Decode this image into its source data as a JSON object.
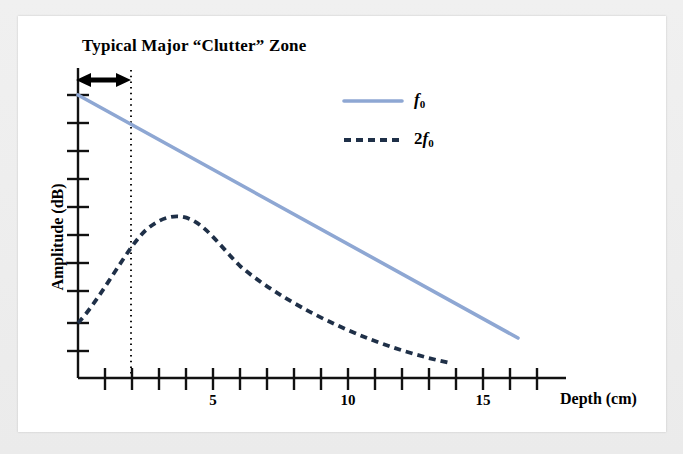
{
  "figure": {
    "title": "Typical Major “Clutter” Zone",
    "background_color": "#ffffff",
    "frame_color": "#f0f0f0"
  },
  "axes": {
    "x": {
      "label": "Depth (cm)",
      "tick_labels": [
        "5",
        "10",
        "15"
      ],
      "tick_values": [
        5,
        10,
        15
      ],
      "range": [
        0,
        18
      ],
      "minor_tick_interval": 1
    },
    "y": {
      "label": "Amplitude (dB)",
      "tick_labels": [],
      "range": [
        0,
        11
      ],
      "minor_tick_interval": 1
    }
  },
  "annotation": {
    "clutter_zone_arrow": "double-headed-arrow",
    "clutter_zone_boundary_depth": 2.0
  },
  "legend": {
    "position": "upper-right-inside",
    "entries": [
      {
        "name": "f0",
        "html": "<i>f</i><sub>0</sub>",
        "style": "solid",
        "color": "#8ea7d3"
      },
      {
        "name": "2f0",
        "html": "2<i>f</i><sub>0</sub>",
        "style": "dashed",
        "color": "#1f3048"
      }
    ]
  },
  "chart_data": {
    "type": "line",
    "title": "Typical Major “Clutter” Zone",
    "xlabel": "Depth (cm)",
    "ylabel": "Amplitude (dB)",
    "xlim": [
      0,
      18
    ],
    "ylim": [
      0,
      11
    ],
    "grid": false,
    "legend_position": "upper-right-inside",
    "annotations": [
      {
        "type": "vertical-dotted-line",
        "label": "clutter zone boundary",
        "x": 2.0
      },
      {
        "type": "double-headed-arrow",
        "label": "Typical Major “Clutter” Zone",
        "x_start": 0.0,
        "x_end": 1.85,
        "y": 11.0
      }
    ],
    "series": [
      {
        "name": "f0",
        "label": "f0",
        "style": "solid",
        "color": "#8ea7d3",
        "x": [
          0,
          2,
          5,
          10,
          16.3
        ],
        "y": [
          10.5,
          9.4,
          7.8,
          5.0,
          1.5
        ]
      },
      {
        "name": "2f0",
        "label": "2f0",
        "style": "dashed",
        "color": "#1f3048",
        "x": [
          0,
          1,
          2,
          3,
          3.5,
          4,
          5,
          6,
          7,
          8,
          9,
          10,
          11,
          12,
          13.8
        ],
        "y": [
          2.0,
          4.1,
          5.7,
          6.6,
          6.7,
          6.65,
          6.3,
          5.8,
          5.3,
          4.75,
          4.2,
          3.6,
          3.05,
          2.5,
          1.6
        ]
      }
    ]
  }
}
